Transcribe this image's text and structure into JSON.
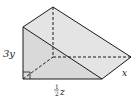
{
  "figure": {
    "type": "triangular-prism",
    "labels": {
      "height": "3y",
      "base_numerator": "1",
      "base_denominator": "2",
      "base_variable": "z",
      "depth": "x"
    },
    "colors": {
      "face_fill": "#e2e2e2",
      "front_fill": "#d6d6d6",
      "edge": "#1a1a1a"
    }
  }
}
